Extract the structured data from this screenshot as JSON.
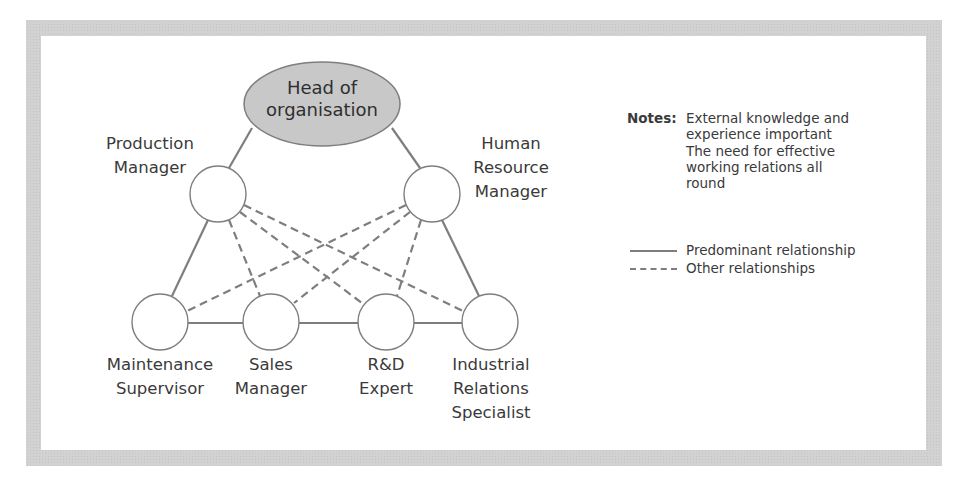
{
  "diagram": {
    "top_node": {
      "lines": [
        "Head of",
        "organisation"
      ],
      "fill": "#c8c8c8"
    },
    "nodes": [
      {
        "id": "production-manager",
        "lines": [
          "Production",
          "Manager"
        ]
      },
      {
        "id": "human-resource-manager",
        "lines": [
          "Human",
          "Resource",
          "Manager"
        ]
      },
      {
        "id": "maintenance-supervisor",
        "lines": [
          "Maintenance",
          "Supervisor"
        ]
      },
      {
        "id": "sales-manager",
        "lines": [
          "Sales",
          "Manager"
        ]
      },
      {
        "id": "rd-expert",
        "lines": [
          "R&D",
          "Expert"
        ]
      },
      {
        "id": "industrial-relations-specialist",
        "lines": [
          "Industrial",
          "Relations",
          "Specialist"
        ]
      }
    ],
    "predominant_relationships": [
      [
        "head-of-organisation",
        "production-manager"
      ],
      [
        "head-of-organisation",
        "human-resource-manager"
      ],
      [
        "production-manager",
        "maintenance-supervisor"
      ],
      [
        "human-resource-manager",
        "industrial-relations-specialist"
      ],
      [
        "maintenance-supervisor",
        "sales-manager"
      ],
      [
        "sales-manager",
        "rd-expert"
      ],
      [
        "rd-expert",
        "industrial-relations-specialist"
      ]
    ],
    "other_relationships": [
      [
        "production-manager",
        "sales-manager"
      ],
      [
        "production-manager",
        "rd-expert"
      ],
      [
        "production-manager",
        "industrial-relations-specialist"
      ],
      [
        "human-resource-manager",
        "maintenance-supervisor"
      ],
      [
        "human-resource-manager",
        "sales-manager"
      ],
      [
        "human-resource-manager",
        "rd-expert"
      ]
    ],
    "line_color": "#7e7e7e"
  },
  "notes": {
    "label": "Notes:",
    "lines": [
      "External knowledge and",
      "experience important",
      "The need for effective",
      "working relations all",
      "round"
    ]
  },
  "legend": {
    "items": [
      {
        "style": "solid",
        "label": "Predominant relationship"
      },
      {
        "style": "dashed",
        "label": "Other relationships"
      }
    ]
  }
}
